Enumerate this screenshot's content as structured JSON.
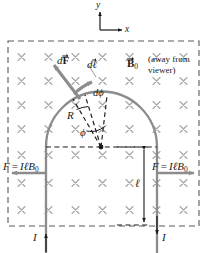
{
  "figure": {
    "colors": {
      "wire": "#8c8c8c",
      "arrow": "#8c8c8c",
      "cross": "#a8a8a8",
      "dashed_border": "#5a5a5a",
      "dashed_construction": "#1a1a1a",
      "text": "#1a1a1a",
      "background": "#ffffff"
    },
    "axes": {
      "x_label": "x",
      "y_label": "y",
      "origin_px": [
        100,
        30
      ]
    },
    "field": {
      "symbol": "B",
      "subscript": "0",
      "vector": true,
      "note_line1": "(away from",
      "note_line2": "viewer)",
      "marker_glyph": "×",
      "marker_rows": 7,
      "marker_cols": 7
    },
    "labels": {
      "dF": {
        "d": "d",
        "symbol": "F",
        "vector": true
      },
      "dl": {
        "d": "d",
        "symbol": "ℓ",
        "vector": true
      },
      "dphi": {
        "d": "d",
        "symbol": "ϕ"
      },
      "phi": "ϕ",
      "R": "R",
      "ell": "ℓ",
      "current_left": "I",
      "current_right": "I",
      "force_left": {
        "F": "F",
        "eq": "=",
        "I": "I",
        "ell": "ℓ",
        "B": "B",
        "sub": "0"
      },
      "force_right": {
        "F": "F",
        "eq": "=",
        "I": "I",
        "ell": "ℓ",
        "B": "B",
        "sub": "0"
      }
    },
    "geometry": {
      "arc_center_px": [
        101,
        147
      ],
      "arc_radius_px": 55,
      "wire_left_x": 46,
      "wire_right_x": 157,
      "diameter_y": 147,
      "wire_bottom_y": 253,
      "ell_dim_x": 144,
      "ell_top_y": 147,
      "ell_bottom_y": 225,
      "border": {
        "left": 8,
        "top": 41,
        "right": 199,
        "bottom": 226
      }
    }
  }
}
